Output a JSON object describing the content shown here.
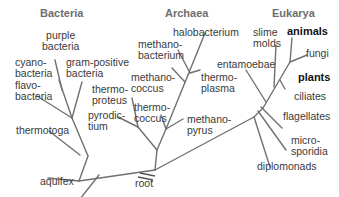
{
  "domains": {
    "bacteria": "Bacteria",
    "archaea": "Archaea",
    "eukarya": "Eukarya"
  },
  "bacteria": {
    "purple_bacteria": "purple\nbacteria",
    "cyanobacteria": "cyano-\nbacteria",
    "gram_positive": "gram-positive\nbacteria",
    "flavobacteria": "flavo-\nbacteria",
    "thermotoga": "thermotoga",
    "aquifex": "aquifex"
  },
  "archaea": {
    "halobacterium": "halobacterium",
    "methanobacterium": "methano-\nbacterium",
    "methanococcus": "methano-\ncoccus",
    "thermoplasma": "thermo-\nplasma",
    "thermoproteus": "thermo-\nproteus",
    "thermococcus": "thermo-\ncoccus",
    "pyrodictium": "pyrodic-\ntium",
    "methanopyrus": "methano-\npyrus"
  },
  "eukarya": {
    "slime_molds": "slime\nmolds",
    "animals": "animals",
    "fungi": "fungi",
    "entamoebae": "entamoebae",
    "plants": "plants",
    "ciliates": "ciliates",
    "flagellates": "flagellates",
    "microsporidia": "micro-\nsporidia",
    "diplomonads": "diplomonads"
  },
  "root_label": "root",
  "colors": {
    "line": "#707070",
    "text": "#3a3a3a",
    "heading": "#6e6e6e",
    "bold_text": "#111111"
  }
}
